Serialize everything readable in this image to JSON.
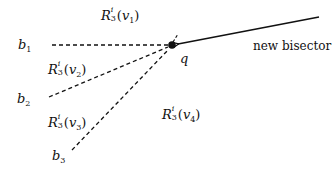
{
  "diagram": {
    "point": {
      "label": "q",
      "x": 172,
      "y": 45
    },
    "new_bisector": {
      "label": "new bisector",
      "from": [
        319,
        17
      ],
      "to": [
        176,
        44
      ],
      "style": "solid",
      "arrow": "toward q"
    },
    "bisectors": [
      {
        "name": "b",
        "index": "1",
        "from": [
          52,
          45
        ],
        "to": [
          168,
          45
        ],
        "style": "dashed"
      },
      {
        "name": "b",
        "index": "2",
        "from": [
          49,
          97
        ],
        "to": [
          168,
          47
        ],
        "style": "dashed"
      },
      {
        "name": "b",
        "index": "3",
        "from": [
          72,
          150
        ],
        "to": [
          169,
          49
        ],
        "style": "dashed"
      }
    ],
    "regions": [
      {
        "base": "R",
        "sup": "i",
        "sub": "3",
        "arg_var": "v",
        "arg_idx": "1"
      },
      {
        "base": "R",
        "sup": "i",
        "sub": "3",
        "arg_var": "v",
        "arg_idx": "2"
      },
      {
        "base": "R",
        "sup": "i",
        "sub": "3",
        "arg_var": "v",
        "arg_idx": "3"
      },
      {
        "base": "R",
        "sup": "i",
        "sub": "3",
        "arg_var": "v",
        "arg_idx": "4"
      }
    ],
    "colors": {
      "ink": "#111111",
      "background": "#ffffff"
    }
  }
}
